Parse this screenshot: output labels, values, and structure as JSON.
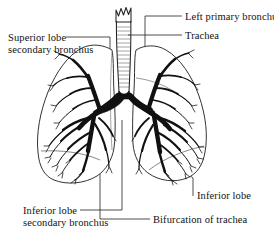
{
  "figure": {
    "name": "bronchial-tree-anatomical-diagram",
    "background_color": "#ffffff",
    "ink_color": "#111111"
  },
  "labels": {
    "superior_lobe_secondary_bronchus": {
      "line1": "Superior lobe",
      "line2": "secondary bronchus"
    },
    "left_primary_bronchus": {
      "line1": "Left primary bronchus"
    },
    "trachea": {
      "line1": "Trachea"
    },
    "inferior_lobe_secondary_bronchus": {
      "line1": "Inferior lobe",
      "line2": "secondary bronchus"
    },
    "inferior_lobe": {
      "line1": "Inferior lobe"
    },
    "bifurcation_of_trachea": {
      "line1": "Bifurcation of trachea"
    }
  },
  "anatomy_parts": [
    "trachea",
    "left-primary-bronchus",
    "right-primary-bronchus",
    "bifurcation-of-trachea",
    "left-lung",
    "right-lung",
    "superior-lobe-secondary-bronchus",
    "inferior-lobe-secondary-bronchus",
    "bronchial-tree"
  ]
}
